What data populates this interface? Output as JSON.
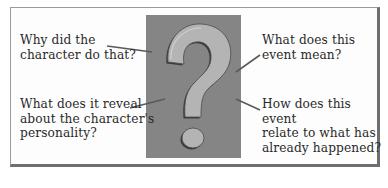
{
  "diagram": {
    "center_symbol": "question-mark",
    "colors": {
      "frame_border": "#9a9a9a",
      "frame_shadow": "#6e6e6e",
      "panel_background": "#858585",
      "question_mark_fill": "#b4b4b4",
      "question_mark_outline": "#3c3c3c",
      "connector_line": "#5a5a5a",
      "text": "#2a2a2a"
    },
    "questions": [
      {
        "position": "top-left",
        "text": "Why did the\ncharacter do that?"
      },
      {
        "position": "top-right",
        "text": "What does this\nevent mean?"
      },
      {
        "position": "bottom-left",
        "text": "What does it reveal\nabout the character's\npersonality?"
      },
      {
        "position": "bottom-right",
        "text": "How does this event\nrelate to what has\nalready happened?"
      }
    ]
  }
}
